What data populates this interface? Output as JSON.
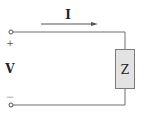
{
  "diagram": {
    "type": "circuit",
    "current_label": "I",
    "voltage_label": "V",
    "plus_sign": "+",
    "minus_sign": "—",
    "impedance_label": "Z",
    "colors": {
      "wire": "#6e6e6e",
      "box_fill": "#e3e3e3",
      "box_stroke": "#7a7a7a",
      "arrow": "#555555",
      "text": "#222222"
    }
  }
}
